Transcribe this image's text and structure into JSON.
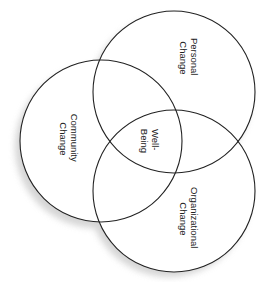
{
  "diagram": {
    "type": "venn",
    "sets": [
      {
        "id": "personal",
        "label_lines": [
          "Personal",
          "Change"
        ]
      },
      {
        "id": "community",
        "label_lines": [
          "Community",
          "Change"
        ]
      },
      {
        "id": "organizational",
        "label_lines": [
          "Organizational",
          "Change"
        ]
      }
    ],
    "center_label_lines": [
      "Well-",
      "Being"
    ],
    "colors": {
      "stroke": "#222222",
      "fill": "#ffffff",
      "shadow": "#c8c8c8",
      "text": "#222222"
    }
  }
}
